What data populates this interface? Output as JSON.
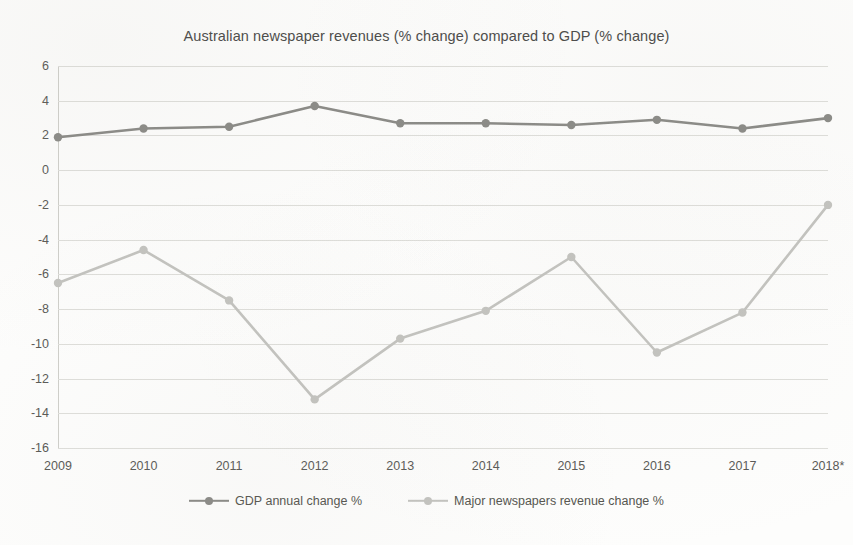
{
  "chart_data": {
    "type": "line",
    "title": "Australian newspaper revenues (% change) compared to GDP (% change)",
    "xlabel": "",
    "ylabel": "",
    "categories": [
      "2009",
      "2010",
      "2011",
      "2012",
      "2013",
      "2014",
      "2015",
      "2016",
      "2017",
      "2018*"
    ],
    "ylim": [
      -16,
      6
    ],
    "ytick_step": 2,
    "yticks": [
      "6",
      "4",
      "2",
      "0",
      "-2",
      "-4",
      "-6",
      "-8",
      "-10",
      "-12",
      "-14",
      "-16"
    ],
    "grid": true,
    "legend_position": "bottom",
    "series": [
      {
        "name": "GDP annual change %",
        "color": "#8a8a86",
        "values": [
          1.9,
          2.4,
          2.5,
          3.7,
          2.7,
          2.7,
          2.6,
          2.9,
          2.4,
          3.0
        ]
      },
      {
        "name": "Major newspapers revenue change %",
        "color": "#c3c3bf",
        "values": [
          -6.5,
          -4.6,
          -7.5,
          -13.2,
          -9.7,
          -8.1,
          -5.0,
          -10.5,
          -8.2,
          -2.0
        ]
      }
    ]
  },
  "legend": {
    "entries": [
      {
        "label": "GDP annual change %"
      },
      {
        "label": "Major newspapers revenue change %"
      }
    ]
  }
}
